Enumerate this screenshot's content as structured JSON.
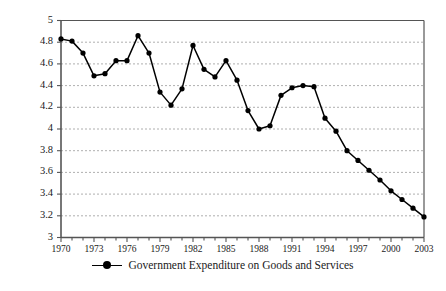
{
  "chart_data": {
    "type": "line",
    "title": "",
    "xlabel": "",
    "ylabel": "Percent of GDP",
    "ylim": [
      3,
      5
    ],
    "ytick_step": 0.2,
    "yticks": [
      "5",
      "4.8",
      "4.6",
      "4.4",
      "4.2",
      "4",
      "3.8",
      "3.6",
      "3.4",
      "3.2",
      "3"
    ],
    "xlim": [
      1970,
      2003
    ],
    "xtick_labels": [
      "1970",
      "1973",
      "1976",
      "1979",
      "1982",
      "1985",
      "1988",
      "1991",
      "1994",
      "1997",
      "2000",
      "2003"
    ],
    "xtick_step": 3,
    "xminor_step": 1,
    "grid": "horizontal-dashed",
    "legend_position": "bottom-center",
    "series": [
      {
        "name": "Government Expenditure on Goods and Services",
        "color": "#000000",
        "marker": "circle",
        "x": [
          1970,
          1971,
          1972,
          1973,
          1974,
          1975,
          1976,
          1977,
          1978,
          1979,
          1980,
          1981,
          1982,
          1983,
          1984,
          1985,
          1986,
          1987,
          1988,
          1989,
          1990,
          1991,
          1992,
          1993,
          1994,
          1995,
          1996,
          1997,
          1998,
          1999,
          2000,
          2001,
          2002,
          2003
        ],
        "values": [
          4.83,
          4.81,
          4.7,
          4.49,
          4.51,
          4.63,
          4.63,
          4.86,
          4.7,
          4.34,
          4.22,
          4.37,
          4.77,
          4.55,
          4.48,
          4.63,
          4.45,
          4.17,
          4.0,
          4.03,
          4.31,
          4.38,
          4.4,
          4.39,
          4.1,
          3.98,
          3.8,
          3.71,
          3.62,
          3.53,
          3.43,
          3.35,
          3.27,
          3.19
        ]
      }
    ]
  },
  "legend": {
    "entry_label": "Government Expenditure on Goods and Services",
    "marker_icon": "line-with-dot-marker-icon"
  },
  "axis": {
    "y_title": "Percent of GDP"
  }
}
